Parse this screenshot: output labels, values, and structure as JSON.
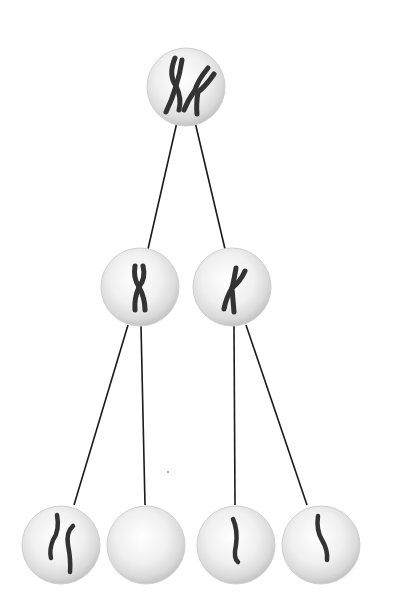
{
  "diagram": {
    "type": "meiosis-nondisjunction-tree",
    "colors": {
      "background": "#ffffff",
      "line": "#1a1a1a",
      "cell_fill_center": "#ffffff",
      "cell_fill_edge": "#c8c8c8",
      "chromosome": "#333333"
    },
    "cells": [
      {
        "id": "parent",
        "level": 0,
        "cx": 186,
        "cy": 87,
        "r": 39,
        "chromosomes": 2,
        "chromosome_type": "duplicated"
      },
      {
        "id": "mid-left",
        "level": 1,
        "cx": 140,
        "cy": 287,
        "r": 39,
        "chromosomes": 1,
        "chromosome_type": "duplicated"
      },
      {
        "id": "mid-right",
        "level": 1,
        "cx": 232,
        "cy": 287,
        "r": 39,
        "chromosomes": 1,
        "chromosome_type": "duplicated"
      },
      {
        "id": "gamete-1",
        "level": 2,
        "cx": 61,
        "cy": 545,
        "r": 39,
        "chromosomes": 2,
        "chromosome_type": "single"
      },
      {
        "id": "gamete-2",
        "level": 2,
        "cx": 146,
        "cy": 545,
        "r": 39,
        "chromosomes": 0,
        "chromosome_type": "none"
      },
      {
        "id": "gamete-3",
        "level": 2,
        "cx": 236,
        "cy": 545,
        "r": 39,
        "chromosomes": 1,
        "chromosome_type": "single"
      },
      {
        "id": "gamete-4",
        "level": 2,
        "cx": 321,
        "cy": 545,
        "r": 39,
        "chromosomes": 1,
        "chromosome_type": "single"
      }
    ],
    "edges": [
      {
        "from": "parent",
        "to": "mid-left",
        "x1": 177,
        "y1": 122,
        "x2": 148,
        "y2": 249
      },
      {
        "from": "parent",
        "to": "mid-right",
        "x1": 195,
        "y1": 122,
        "x2": 225,
        "y2": 249
      },
      {
        "from": "mid-left",
        "to": "gamete-1",
        "x1": 128,
        "y1": 325,
        "x2": 74,
        "y2": 505
      },
      {
        "from": "mid-left",
        "to": "gamete-2",
        "x1": 141,
        "y1": 326,
        "x2": 145,
        "y2": 505
      },
      {
        "from": "mid-right",
        "to": "gamete-3",
        "x1": 234,
        "y1": 326,
        "x2": 235,
        "y2": 505
      },
      {
        "from": "mid-right",
        "to": "gamete-4",
        "x1": 246,
        "y1": 325,
        "x2": 307,
        "y2": 505
      }
    ]
  }
}
